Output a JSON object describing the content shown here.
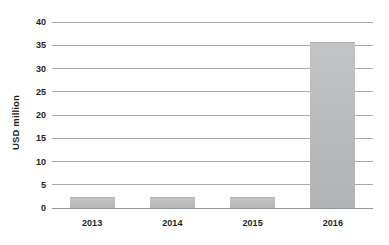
{
  "chart_data": {
    "type": "bar",
    "title": "",
    "subtitle": "",
    "xlabel": "",
    "ylabel": "USD million",
    "categories": [
      "2013",
      "2014",
      "2015",
      "2016"
    ],
    "values": [
      2.4,
      2.4,
      2.4,
      35.6
    ],
    "series": [
      {
        "name": "USD million",
        "values": [
          2.4,
          2.4,
          2.4,
          35.6
        ]
      }
    ],
    "ylim": [
      0,
      40
    ],
    "yticks": [
      0,
      5,
      10,
      15,
      20,
      25,
      30,
      35,
      40
    ],
    "ytick_labels": [
      "0",
      "5",
      "10",
      "15",
      "20",
      "25",
      "30",
      "35",
      "40"
    ],
    "grid": true,
    "grid_axis": "y",
    "legend": false,
    "legend_position": "none",
    "annotations": [],
    "colors": {
      "bar_fill": "#bcbdbf",
      "gridline": "#a7a9ac",
      "baseline": "#939598",
      "text": "#231f20",
      "background": "#ffffff"
    }
  }
}
